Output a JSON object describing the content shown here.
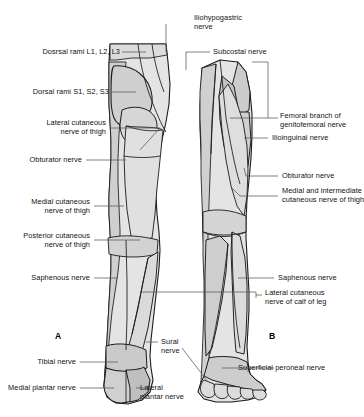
{
  "figure": {
    "panels": [
      {
        "id": "A",
        "label": "A",
        "view": "posterior",
        "x": 58,
        "y": 337
      },
      {
        "id": "B",
        "label": "B",
        "view": "anterior",
        "x": 272,
        "y": 337
      }
    ],
    "colors": {
      "background": "#ffffff",
      "outline": "#1a1a1a",
      "fill_light": "#e6e6e6",
      "fill_mid": "#d4d4d4",
      "fill_dark": "#bdbdbd",
      "leader_line": "#555555",
      "text": "#111111"
    }
  },
  "labels": {
    "iliohypogastric_nerve": {
      "line1": "Iliohypogastric",
      "line2": "nerve"
    },
    "subcostal_nerve": "Subcostal nerve",
    "dorsal_rami_lumbar": "Dosrsal rami L1, L2, L3",
    "dorsal_rami_sacral": "Dorsal rami S1, S2, S3",
    "lateral_cutaneous_nerve_of_thigh": {
      "line1": "Lateral cutaneous",
      "line2": "nerve of thigh"
    },
    "femoral_branch_genitofemoral": {
      "line1": "Femoral branch of",
      "line2": "genitofemoral nerve"
    },
    "ilioinguinal_nerve": "Ilioinguinal nerve",
    "obturator_nerve_left": "Obturator nerve",
    "obturator_nerve_right": "Obturator nerve",
    "medial_cutaneous_nerve_of_thigh": {
      "line1": "Medial cutaneous",
      "line2": "nerve of thigh"
    },
    "medial_intermediate_cutaneous": {
      "line1": "Medial and intermediate",
      "line2": "cutaneous nerve of thigh"
    },
    "posterior_cutaneous_nerve_of_thigh": {
      "line1": "Posterior cutaneous",
      "line2": "nerve of thigh"
    },
    "saphenous_nerve_left": "Saphenous nerve",
    "saphenous_nerve_right": "Saphenous nerve",
    "lateral_cutaneous_nerve_of_calf": {
      "line1": "Lateral cutaneous",
      "line2": "nerve of calf of leg"
    },
    "sural_nerve": {
      "line1": "Sural",
      "line2": "nerve"
    },
    "tibial_nerve": "Tibial nerve",
    "superficial_peroneal_nerve": "Superficial peroneal nerve",
    "medial_plantar_nerve": "Medial plantar nerve",
    "lateral_plantar_nerve": {
      "line1": "Lateral",
      "line2": "plantar nerve"
    }
  }
}
